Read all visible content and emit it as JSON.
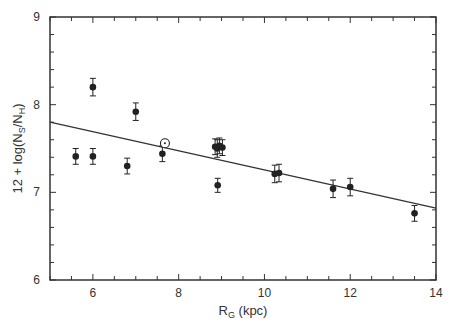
{
  "chart_data": {
    "type": "scatter",
    "title": "",
    "xlabel": "R_G (kpc)",
    "xlabel_main": "R",
    "xlabel_sub": "G",
    "xlabel_rest": " (kpc)",
    "ylabel": "12 + log(N_S/N_H)",
    "ylabel_pre": "12 + log(N",
    "ylabel_sub1": "S",
    "ylabel_mid": "/N",
    "ylabel_sub2": "H",
    "ylabel_post": ")",
    "xlim": [
      5,
      14
    ],
    "ylim": [
      6,
      9
    ],
    "x_major_ticks": [
      6,
      8,
      10,
      12,
      14
    ],
    "x_minor_step": 0.5,
    "y_major_ticks": [
      6,
      7,
      8,
      9
    ],
    "y_minor_step": 0.2,
    "grid": false,
    "legend": "none",
    "colors": {
      "marker": "#222222",
      "line": "#333333",
      "axis": "#333333"
    },
    "series": [
      {
        "name": "HII regions",
        "marker": "filled-circle",
        "points": [
          {
            "x": 5.6,
            "y": 7.41,
            "err": 0.09
          },
          {
            "x": 6.0,
            "y": 8.2,
            "err": 0.1
          },
          {
            "x": 6.0,
            "y": 7.41,
            "err": 0.09
          },
          {
            "x": 6.8,
            "y": 7.3,
            "err": 0.09
          },
          {
            "x": 7.0,
            "y": 7.92,
            "err": 0.1
          },
          {
            "x": 7.62,
            "y": 7.44,
            "err": 0.09
          },
          {
            "x": 8.85,
            "y": 7.52,
            "err": 0.09
          },
          {
            "x": 8.9,
            "y": 7.5,
            "err": 0.1
          },
          {
            "x": 8.95,
            "y": 7.53,
            "err": 0.09
          },
          {
            "x": 9.02,
            "y": 7.51,
            "err": 0.09
          },
          {
            "x": 8.91,
            "y": 7.08,
            "err": 0.08
          },
          {
            "x": 10.24,
            "y": 7.21,
            "err": 0.1
          },
          {
            "x": 10.34,
            "y": 7.22,
            "err": 0.1
          },
          {
            "x": 11.6,
            "y": 7.04,
            "err": 0.1
          },
          {
            "x": 12.0,
            "y": 7.06,
            "err": 0.1
          },
          {
            "x": 13.5,
            "y": 6.76,
            "err": 0.09
          }
        ]
      },
      {
        "name": "Sun",
        "marker": "sun-symbol",
        "points": [
          {
            "x": 7.68,
            "y": 7.56
          }
        ]
      }
    ],
    "fit_line": {
      "name": "linear fit",
      "x": [
        5,
        14
      ],
      "y": [
        7.8,
        6.82
      ]
    }
  }
}
